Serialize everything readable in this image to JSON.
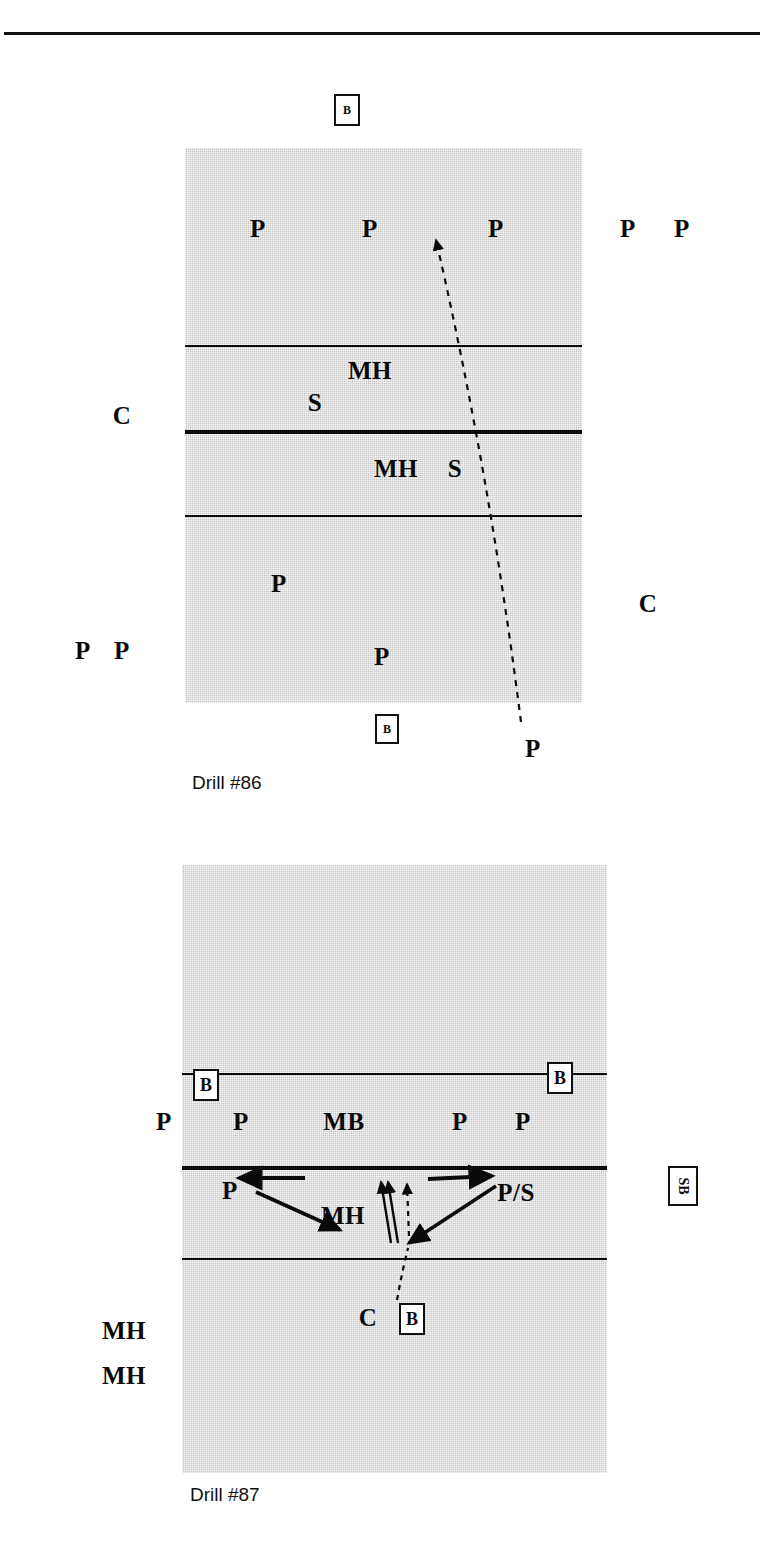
{
  "page": {
    "background": "#ffffff",
    "court_fill": "#c6c6c6",
    "ink": "#0a0a0a",
    "top_rule": true
  },
  "drills": [
    {
      "id": "drill-86",
      "caption": "Drill #86",
      "court": {
        "x": 185,
        "y": 148,
        "w": 397,
        "h": 555
      },
      "lines": [
        {
          "name": "attack-line-far",
          "y": 345,
          "weight": "thin"
        },
        {
          "name": "net-line",
          "y": 430,
          "weight": "net"
        },
        {
          "name": "attack-line-near",
          "y": 515,
          "weight": "thin"
        }
      ],
      "labels": [
        {
          "name": "player-far-left",
          "text": "P",
          "x": 258,
          "y": 228
        },
        {
          "name": "player-far-center",
          "text": "P",
          "x": 370,
          "y": 228
        },
        {
          "name": "player-far-right",
          "text": "P",
          "x": 496,
          "y": 228
        },
        {
          "name": "player-outside-right-1",
          "text": "P",
          "x": 628,
          "y": 228
        },
        {
          "name": "player-outside-right-2",
          "text": "P",
          "x": 682,
          "y": 228
        },
        {
          "name": "middle-hitter-far",
          "text": "MH",
          "x": 370,
          "y": 370
        },
        {
          "name": "setter-far",
          "text": "S",
          "x": 315,
          "y": 402
        },
        {
          "name": "coach-left",
          "text": "C",
          "x": 122,
          "y": 415
        },
        {
          "name": "middle-hitter-near",
          "text": "MH",
          "x": 396,
          "y": 468
        },
        {
          "name": "setter-near",
          "text": "S",
          "x": 455,
          "y": 468
        },
        {
          "name": "player-near-left",
          "text": "P",
          "x": 279,
          "y": 583
        },
        {
          "name": "coach-right",
          "text": "C",
          "x": 648,
          "y": 603
        },
        {
          "name": "player-outside-left-1",
          "text": "P",
          "x": 83,
          "y": 650
        },
        {
          "name": "player-outside-left-2",
          "text": "P",
          "x": 122,
          "y": 650
        },
        {
          "name": "player-near-center",
          "text": "P",
          "x": 382,
          "y": 656
        },
        {
          "name": "player-server",
          "text": "P",
          "x": 533,
          "y": 748
        }
      ],
      "ball_boxes": [
        {
          "name": "ball-box-top",
          "text": "B",
          "x": 347,
          "y": 110,
          "w": 26,
          "h": 32,
          "size": "small",
          "rotated": false
        },
        {
          "name": "ball-box-bottom",
          "text": "B",
          "x": 387,
          "y": 729,
          "w": 24,
          "h": 30,
          "size": "small",
          "rotated": false
        }
      ],
      "arrows": [
        {
          "name": "serve-path-arrow",
          "type": "dashed",
          "from": [
            521,
            722
          ],
          "to": [
            436,
            232
          ],
          "bend": [
            487,
            470
          ]
        }
      ]
    },
    {
      "id": "drill-87",
      "caption": "Drill #87",
      "court": {
        "x": 182,
        "y": 865,
        "w": 425,
        "h": 608
      },
      "lines": [
        {
          "name": "attack-line-far",
          "y": 1073,
          "weight": "thin"
        },
        {
          "name": "net-line",
          "y": 1166,
          "weight": "net"
        },
        {
          "name": "attack-line-near",
          "y": 1258,
          "weight": "thin"
        }
      ],
      "labels": [
        {
          "name": "player-left-outside",
          "text": "P",
          "x": 164,
          "y": 1121
        },
        {
          "name": "player-left-in",
          "text": "P",
          "x": 241,
          "y": 1121
        },
        {
          "name": "middle-blocker",
          "text": "MB",
          "x": 344,
          "y": 1121
        },
        {
          "name": "player-right-in",
          "text": "P",
          "x": 460,
          "y": 1121
        },
        {
          "name": "player-right-outside",
          "text": "P",
          "x": 523,
          "y": 1121
        },
        {
          "name": "player-near-left",
          "text": "P",
          "x": 230,
          "y": 1190
        },
        {
          "name": "player-setter-right",
          "text": "P/S",
          "x": 516,
          "y": 1192
        },
        {
          "name": "middle-hitter-near",
          "text": "MH",
          "x": 343,
          "y": 1215
        },
        {
          "name": "coach-near",
          "text": "C",
          "x": 368,
          "y": 1317
        },
        {
          "name": "middle-hitter-queue-1",
          "text": "MH",
          "x": 124,
          "y": 1330
        },
        {
          "name": "middle-hitter-queue-2",
          "text": "MH",
          "x": 124,
          "y": 1375
        }
      ],
      "ball_boxes": [
        {
          "name": "ball-box-left",
          "text": "B",
          "x": 206,
          "y": 1085,
          "w": 26,
          "h": 32,
          "size": "med",
          "rotated": false
        },
        {
          "name": "ball-box-right",
          "text": "B",
          "x": 560,
          "y": 1078,
          "w": 26,
          "h": 32,
          "size": "med",
          "rotated": false
        },
        {
          "name": "shag-ball-box-right",
          "text": "SB",
          "x": 683,
          "y": 1186,
          "w": 30,
          "h": 40,
          "size": "med",
          "rotated": true
        },
        {
          "name": "ball-box-near-coach",
          "text": "B",
          "x": 412,
          "y": 1319,
          "w": 26,
          "h": 32,
          "size": "med",
          "rotated": false
        }
      ],
      "arrows": [
        {
          "name": "arrow-left-horizontal",
          "type": "solid",
          "from": [
            305,
            1178
          ],
          "to": [
            240,
            1178
          ]
        },
        {
          "name": "arrow-right-horizontal",
          "type": "solid",
          "from": [
            428,
            1178
          ],
          "to": [
            492,
            1176
          ]
        },
        {
          "name": "arrow-player-to-mh",
          "type": "solid",
          "from": [
            258,
            1192
          ],
          "to": [
            342,
            1231
          ]
        },
        {
          "name": "arrow-ps-to-center",
          "type": "solid",
          "from": [
            494,
            1187
          ],
          "to": [
            408,
            1243
          ]
        },
        {
          "name": "arrow-approach-1",
          "type": "solid",
          "from": [
            392,
            1240
          ],
          "to": [
            382,
            1183
          ]
        },
        {
          "name": "arrow-approach-2",
          "type": "solid",
          "from": [
            398,
            1240
          ],
          "to": [
            388,
            1183
          ]
        },
        {
          "name": "arrow-set-dashed",
          "type": "dashed",
          "from": [
            408,
            1235
          ],
          "to": [
            406,
            1185
          ]
        },
        {
          "name": "arrow-coach-toss",
          "type": "dashed",
          "from": [
            398,
            1296
          ],
          "to": [
            406,
            1245
          ]
        }
      ]
    }
  ]
}
